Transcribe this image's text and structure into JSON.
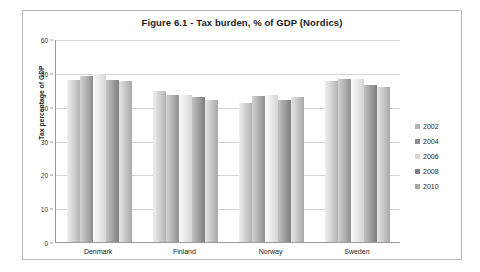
{
  "chart_data": {
    "type": "bar",
    "title": "Figure 6.1 - Tax burden, % of GDP (Nordics)",
    "xlabel": "",
    "ylabel": "Tax percentage of GDP",
    "ylim": [
      0,
      60
    ],
    "ytick_step": 10,
    "yticks": [
      60,
      50,
      40,
      30,
      20,
      10,
      0
    ],
    "grid": true,
    "legend_position": "right",
    "categories": [
      "Denmark",
      "Finland",
      "Norway",
      "Sweden"
    ],
    "series": [
      {
        "name": "2002",
        "values": [
          47.9,
          44.6,
          41.1,
          47.5
        ]
      },
      {
        "name": "2004",
        "values": [
          49.0,
          43.4,
          43.3,
          48.1
        ]
      },
      {
        "name": "2006",
        "values": [
          49.6,
          43.5,
          43.5,
          48.3
        ]
      },
      {
        "name": "2008",
        "values": [
          47.8,
          42.8,
          42.1,
          46.4
        ]
      },
      {
        "name": "2010",
        "values": [
          47.6,
          42.1,
          42.9,
          45.8
        ]
      }
    ],
    "colors": [
      "#b4b4b4",
      "#8f8f8f",
      "#d6d6d6",
      "#7e7e7e",
      "#a8a8a8"
    ]
  }
}
